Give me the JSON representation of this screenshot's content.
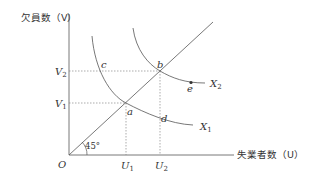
{
  "diagram": {
    "type": "UV curve (Beveridge curve) diagram",
    "y_axis_label": "欠員数（V）",
    "x_axis_label": "失業者数（U）",
    "origin_label": "O",
    "angle_label": "45°",
    "y_ticks": [
      {
        "label": "V",
        "sub": "2"
      },
      {
        "label": "V",
        "sub": "1"
      }
    ],
    "x_ticks": [
      {
        "label": "U",
        "sub": "1"
      },
      {
        "label": "U",
        "sub": "2"
      }
    ],
    "points": {
      "a": "a",
      "b": "b",
      "c": "c",
      "d": "d",
      "e": "e"
    },
    "curves": [
      {
        "label": "X",
        "sub": "1"
      },
      {
        "label": "X",
        "sub": "2"
      }
    ],
    "colors": {
      "line": "#555555",
      "text": "#333333",
      "dotted": "#888888"
    }
  }
}
